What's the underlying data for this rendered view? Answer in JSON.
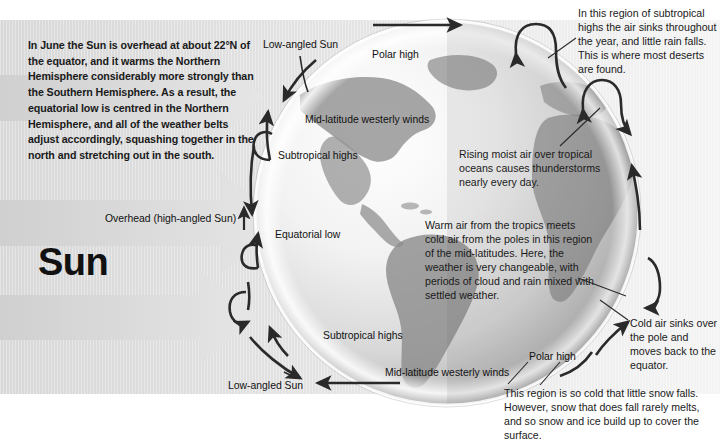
{
  "figure": {
    "title_word": "Sun",
    "intro_text": "In June the Sun is overhead at about 22°N of the equator, and it warms the Northern Hemisphere considerably more strongly than the Southern Hemisphere. As a result, the equatorial low is centred in the Northern Hemisphere, and all of the weather belts adjust accordingly, squashing together in the north and stretching out in the south."
  },
  "callouts": {
    "deserts": "In this region of subtropical highs the air sinks throughout the year, and little rain falls. This is where most deserts are found.",
    "rising_moist_air": "Rising moist air over tropical oceans causes thunderstorms nearly every day.",
    "mid_latitudes": "Warm air from the tropics meets cold air from the poles in this region of the mid-latitudes. Here, the weather is very changeable, with periods of cloud and rain mixed with settled weather.",
    "cold_air_sinks": "Cold air sinks over the pole and moves back to the equator.",
    "polar_snow": "This region is so cold that little snow falls. However, snow that does fall rarely melts, and so snow and ice build up to cover the surface."
  },
  "labels": {
    "low_angled_sun_top": "Low-angled Sun",
    "polar_high_top": "Polar high",
    "mid_latitude_westerlies_top": "Mid-latitude westerly winds",
    "subtropical_highs_top": "Subtropical highs",
    "overhead_sun": "Overhead (high-angled Sun)",
    "equatorial_low": "Equatorial low",
    "subtropical_highs_bottom": "Subtropical highs",
    "mid_latitude_westerlies_bottom": "Mid-latitude westerly winds",
    "polar_high_bottom": "Polar high",
    "low_angled_sun_bottom": "Low-angled Sun"
  },
  "colors": {
    "panel_background": "#e4e4e4",
    "arrow_stroke": "#2a2a2a",
    "sun_ray_fill": "#d0d0d0",
    "globe_land": "#8f8f8f",
    "globe_ocean": "#e9e9e9",
    "text": "#1a1a1a"
  }
}
